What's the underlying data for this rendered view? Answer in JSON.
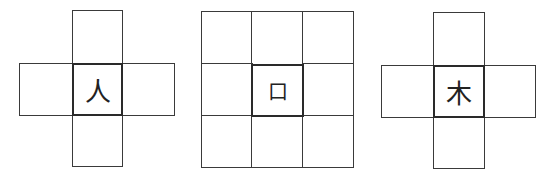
{
  "figures": [
    {
      "layout": "cross",
      "character": "人"
    },
    {
      "layout": "3x3-grid",
      "character": "口"
    },
    {
      "layout": "cross",
      "character": "木"
    }
  ],
  "colors": {
    "line": "#3a3a3a",
    "center_border": "#2a2a2a",
    "background": "#ffffff"
  }
}
